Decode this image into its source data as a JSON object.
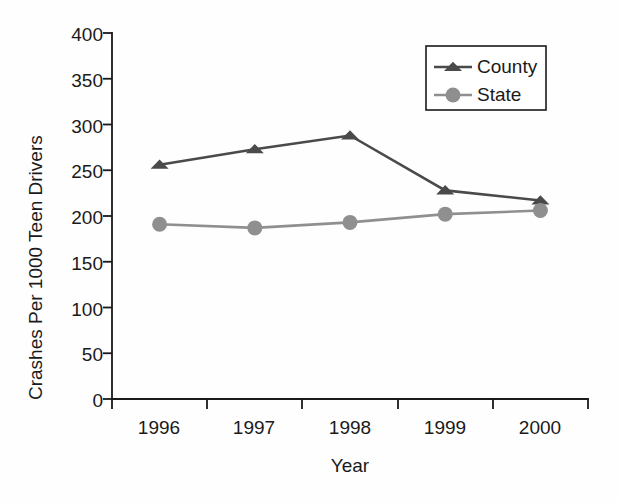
{
  "chart_data": {
    "type": "line",
    "title": "",
    "xlabel": "Year",
    "ylabel": "Crashes Per 1000 Teen Drivers",
    "categories": [
      "1996",
      "1997",
      "1998",
      "1999",
      "2000"
    ],
    "xtick_labels": [
      "1996",
      "1997",
      "1998",
      "1999",
      "2000"
    ],
    "ytick_labels": [
      "0",
      "50",
      "100",
      "150",
      "200",
      "250",
      "300",
      "350",
      "400"
    ],
    "ytick_values": [
      0,
      50,
      100,
      150,
      200,
      250,
      300,
      350,
      400
    ],
    "ylim": [
      0,
      400
    ],
    "grid": false,
    "legend_position": "top-right",
    "series": [
      {
        "name": "County",
        "marker": "triangle",
        "color": "#4a4a4a",
        "values": [
          256,
          273,
          288,
          228,
          217
        ]
      },
      {
        "name": "State",
        "marker": "circle",
        "color": "#8f8f8f",
        "values": [
          191,
          187,
          193,
          202,
          206
        ]
      }
    ]
  },
  "legend": {
    "entries": [
      {
        "label": "County"
      },
      {
        "label": "State"
      }
    ]
  },
  "axes": {
    "x_title": "Year",
    "y_title": "Crashes Per 1000 Teen Drivers"
  }
}
